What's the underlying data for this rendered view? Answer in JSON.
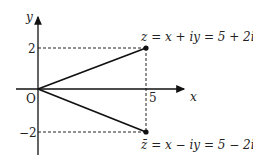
{
  "diagram": {
    "type": "complex-plane",
    "axes": {
      "x_label": "x",
      "y_label": "y",
      "origin_label": "O",
      "x_ticks": [
        {
          "value": 5,
          "label": "5"
        }
      ],
      "y_ticks": [
        {
          "value": 2,
          "label": "2"
        },
        {
          "value": -2,
          "label": "−2"
        }
      ]
    },
    "points": [
      {
        "name": "z",
        "x": 5,
        "y": 2,
        "label": "z = x + iy = 5 + 2i"
      },
      {
        "name": "z-conjugate",
        "x": 5,
        "y": -2,
        "label": "z̄ = x − iy = 5 − 2i"
      }
    ],
    "colors": {
      "line": "#111111",
      "dashed": "#222222",
      "background": "#ffffff"
    }
  },
  "labels": {
    "y_axis": "y",
    "x_axis": "x",
    "origin": "O",
    "tick_y_pos": "2",
    "tick_y_neg": "−2",
    "tick_x": "5",
    "point_z": "z = x + iy = 5 + 2i",
    "point_zbar": "z̄ = x − iy = 5 − 2i"
  }
}
